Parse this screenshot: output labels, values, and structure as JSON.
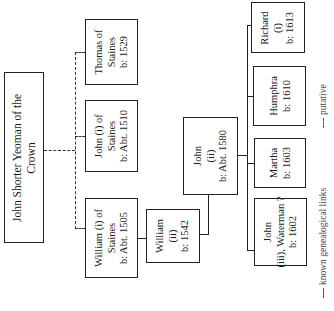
{
  "diagram": {
    "type": "family-tree",
    "orientation": "rotated-90-ccw",
    "root": {
      "id": "john-shorter",
      "lines": [
        "John Shorter Yeoman of the",
        "Crown"
      ]
    },
    "generation_2": [
      {
        "id": "william-i",
        "lines": [
          "William (i) of",
          "Staines",
          "b: Abt. 1505"
        ],
        "link": "putative"
      },
      {
        "id": "john-i",
        "lines": [
          "John (i) of",
          "Staines",
          "b: Abt. 1510"
        ],
        "link": "putative"
      },
      {
        "id": "thomas",
        "lines": [
          "Thomas of",
          "Staines",
          "b: 1529"
        ],
        "link": "putative"
      }
    ],
    "generation_3": [
      {
        "id": "william-ii",
        "parent": "william-i",
        "lines": [
          "William",
          "(ii)",
          "b: 1542"
        ],
        "link": "known"
      }
    ],
    "generation_4": [
      {
        "id": "john-ii",
        "parent": "william-ii",
        "lines": [
          "John",
          "(ii)",
          "b: Abt. 1580"
        ],
        "link": "known"
      }
    ],
    "generation_5": [
      {
        "id": "john-iii",
        "parent": "john-ii",
        "lines": [
          "John",
          "(iii), Waterman ?",
          "b: 1602"
        ],
        "link": "known"
      },
      {
        "id": "martha",
        "parent": "john-ii",
        "lines": [
          "Martha",
          "b: 1603"
        ],
        "link": "known"
      },
      {
        "id": "humphra",
        "parent": "john-ii",
        "lines": [
          "Humphra",
          "b: 1610"
        ],
        "link": "known"
      },
      {
        "id": "richard-i",
        "parent": "john-ii",
        "lines": [
          "Richard",
          "(i)",
          "b: 1613"
        ],
        "link": "known"
      }
    ],
    "legend": {
      "known": "known genealogical links",
      "putative": "putative"
    }
  }
}
